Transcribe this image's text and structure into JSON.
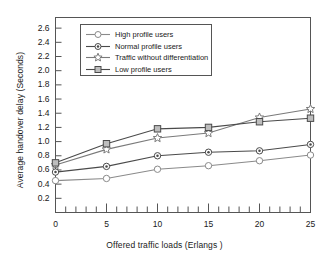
{
  "chart_data": {
    "type": "line",
    "title": "",
    "xlabel": "Offered traffic loads (Erlangs )",
    "ylabel": "Average handover delay (Seconds)",
    "x": [
      0,
      5,
      10,
      15,
      20,
      25
    ],
    "xlim": [
      0,
      25
    ],
    "ylim": [
      0,
      2.75
    ],
    "xticks": [
      0,
      5,
      10,
      15,
      20,
      25
    ],
    "xtick_labels": [
      "0",
      "5",
      "10",
      "15",
      "20",
      "25"
    ],
    "x_minor_tick_step": 1,
    "yticks": [
      0.2,
      0.4,
      0.6,
      0.8,
      1.0,
      1.2,
      1.4,
      1.6,
      1.8,
      2.0,
      2.2,
      2.4,
      2.6
    ],
    "ytick_labels": [
      "0.2",
      "0.4",
      "0.6",
      "0.8",
      "1.0",
      "1.2",
      "1.4",
      "1.6",
      "1.8",
      "2.0",
      "2.2",
      "2.4",
      "2.6"
    ],
    "grid": false,
    "legend_position": "upper-left-inside",
    "series": [
      {
        "name": "High profile users",
        "marker": "circle-open",
        "color": "#8a8a8a",
        "values": [
          0.45,
          0.48,
          0.61,
          0.66,
          0.73,
          0.81
        ]
      },
      {
        "name": "Normal profile users",
        "marker": "circle-dot",
        "color": "#4a4a4a",
        "values": [
          0.57,
          0.65,
          0.8,
          0.85,
          0.87,
          0.96
        ]
      },
      {
        "name": "Traffic without differentiation",
        "marker": "star",
        "color": "#7a7a7a",
        "values": [
          0.67,
          0.89,
          1.05,
          1.12,
          1.34,
          1.46
        ]
      },
      {
        "name": "Low profile users",
        "marker": "square",
        "color": "#4a4a4a",
        "values": [
          0.7,
          0.97,
          1.18,
          1.2,
          1.28,
          1.33
        ]
      }
    ]
  },
  "legend": {
    "entries": [
      {
        "label": "High profile users"
      },
      {
        "label": "Normal profile users"
      },
      {
        "label": "Traffic without differentiation"
      },
      {
        "label": "Low profile users"
      }
    ]
  }
}
